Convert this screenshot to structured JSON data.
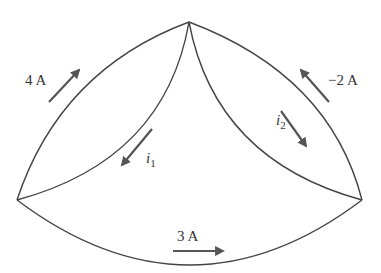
{
  "diagram": {
    "type": "circuit-node-diagram",
    "wire_color": "#444444",
    "arrow_color": "#555555",
    "nodes": [
      {
        "id": "top",
        "x": 189,
        "y": 22
      },
      {
        "id": "left",
        "x": 17,
        "y": 200
      },
      {
        "id": "right",
        "x": 362,
        "y": 200
      }
    ],
    "branches": [
      {
        "id": "outer-left",
        "from": "left",
        "to": "top",
        "current": {
          "label": "4 A",
          "direction": "toward top"
        }
      },
      {
        "id": "outer-right",
        "from": "right",
        "to": "top",
        "current": {
          "label": "−2 A",
          "direction": "toward top"
        }
      },
      {
        "id": "bottom",
        "from": "left",
        "to": "right",
        "current": {
          "label": "3 A",
          "direction": "toward right"
        }
      },
      {
        "id": "inner-left",
        "from": "top",
        "to": "left",
        "current": {
          "label": "i",
          "subscript": "1",
          "direction": "toward left"
        }
      },
      {
        "id": "inner-right",
        "from": "top",
        "to": "right",
        "current": {
          "label": "i",
          "subscript": "2",
          "direction": "toward right"
        }
      }
    ]
  },
  "labels": {
    "four_a": "4 A",
    "minus_two_a": "−2 A",
    "three_a": "3 A",
    "i1_main": "i",
    "i1_sub": "1",
    "i2_main": "i",
    "i2_sub": "2"
  }
}
